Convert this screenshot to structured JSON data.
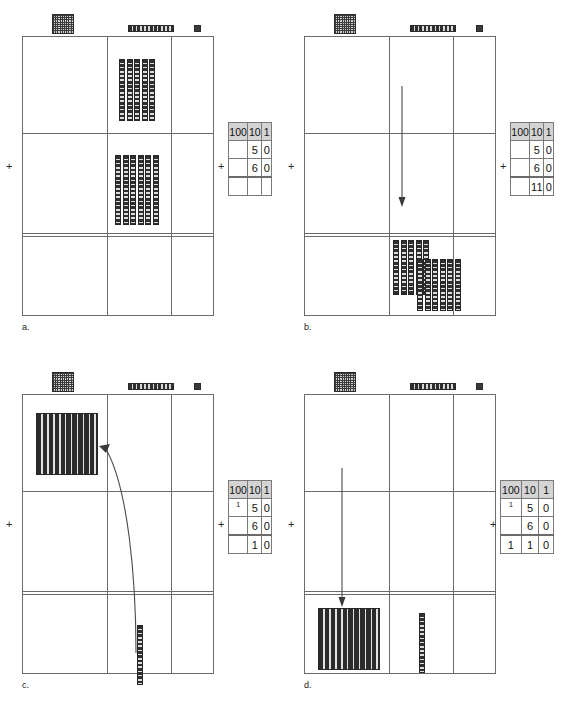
{
  "diagram": {
    "equation": {
      "addend1": 50,
      "addend2": 60,
      "sum": 110
    }
  },
  "legend": {
    "hundred_icon": "hundreds-flat-icon",
    "ten_icon": "tens-rod-icon",
    "one_icon": "ones-unit-icon"
  },
  "symbols": {
    "plus": "+"
  },
  "panels": [
    {
      "id": "a",
      "label": "a.",
      "table": {
        "headers": [
          "100",
          "10",
          "1"
        ],
        "rows": [
          {
            "carry": "",
            "hundreds": "",
            "tens": "5",
            "ones": "0"
          },
          {
            "carry": "",
            "hundreds": "",
            "tens": "6",
            "ones": "0"
          }
        ],
        "sum": {
          "hundreds": "",
          "tens": "",
          "ones": ""
        }
      },
      "blocks": {
        "row1_tens": 5,
        "row2_tens": 6,
        "answer_tens": 0,
        "answer_hundreds": 0
      },
      "arrow": "none"
    },
    {
      "id": "b",
      "label": "b.",
      "table": {
        "headers": [
          "100",
          "10",
          "1"
        ],
        "rows": [
          {
            "carry": "",
            "hundreds": "",
            "tens": "5",
            "ones": "0"
          },
          {
            "carry": "",
            "hundreds": "",
            "tens": "6",
            "ones": "0"
          }
        ],
        "sum": {
          "hundreds": "",
          "tens": "11",
          "ones": "0"
        }
      },
      "blocks": {
        "row1_tens": 0,
        "row2_tens": 0,
        "answer_tens": 11,
        "answer_hundreds": 0
      },
      "arrow": "straight-down-tens"
    },
    {
      "id": "c",
      "label": "c.",
      "table": {
        "headers": [
          "100",
          "10",
          "1"
        ],
        "rows": [
          {
            "carry": "1",
            "hundreds": "",
            "tens": "5",
            "ones": "0"
          },
          {
            "carry": "",
            "hundreds": "",
            "tens": "6",
            "ones": "0"
          }
        ],
        "sum": {
          "hundreds": "",
          "tens": "1",
          "ones": "0"
        }
      },
      "blocks": {
        "regrouped_flat": 1,
        "answer_tens": 1
      },
      "arrow": "curved-regroup-to-hundreds"
    },
    {
      "id": "d",
      "label": "d.",
      "table": {
        "headers": [
          "100",
          "10",
          "1"
        ],
        "rows": [
          {
            "carry": "1",
            "hundreds": "",
            "tens": "5",
            "ones": "0"
          },
          {
            "carry": "",
            "hundreds": "",
            "tens": "6",
            "ones": "0"
          }
        ],
        "sum": {
          "hundreds": "1",
          "tens": "1",
          "ones": "0"
        }
      },
      "blocks": {
        "answer_hundreds": 1,
        "answer_tens": 1
      },
      "arrow": "straight-down-hundreds"
    }
  ],
  "colors": {
    "block_dark": "#2f2f2f",
    "block_light": "#cfcfcf",
    "grid_line": "#6b6b6b",
    "table_header_bg": "#d4d4d4"
  }
}
